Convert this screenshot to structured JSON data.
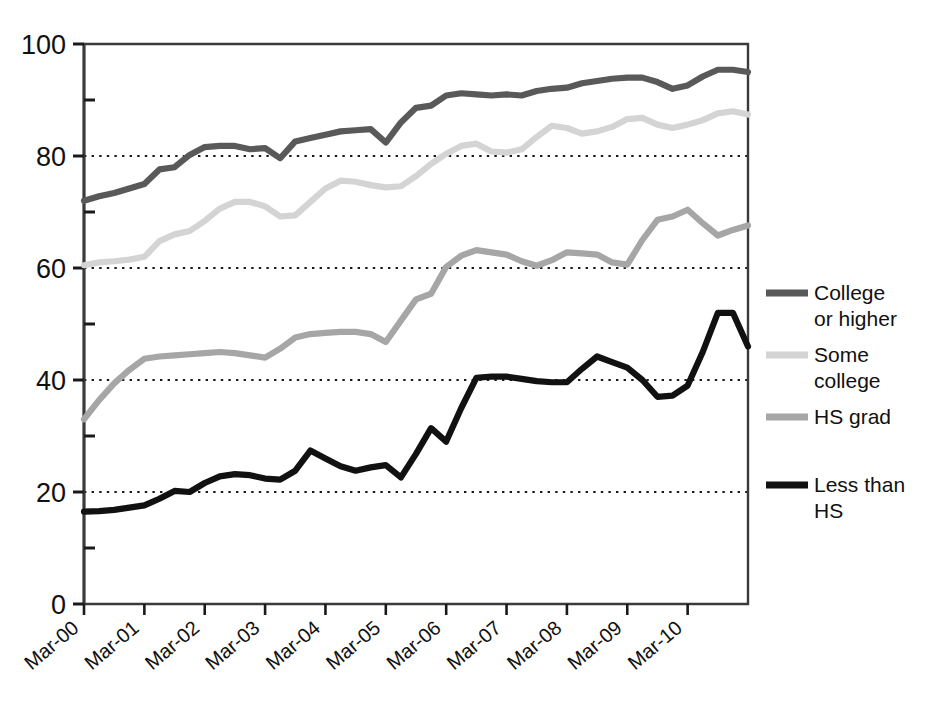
{
  "chart_data": {
    "type": "line",
    "title": "",
    "xlabel": "",
    "ylabel": "",
    "ylim": [
      0,
      100
    ],
    "yticks": [
      0,
      20,
      40,
      60,
      80,
      100
    ],
    "yticklabels": [
      "0",
      "20",
      "40",
      "60",
      "80",
      "100"
    ],
    "minor_yticks": [
      10,
      30,
      50,
      70,
      90
    ],
    "grid": "horizontal dotted at 20, 40, 60, 80",
    "legend_position": "right",
    "xticklabels": [
      "Mar-00",
      "Mar-01",
      "Mar-02",
      "Mar-03",
      "Mar-04",
      "Mar-05",
      "Mar-06",
      "Mar-07",
      "Mar-08",
      "Mar-09",
      "Mar-10"
    ],
    "x_tick_indices": [
      0,
      4,
      8,
      12,
      16,
      20,
      24,
      28,
      32,
      36,
      40
    ],
    "x_points": 45,
    "x_labels_rotation": -40,
    "series": [
      {
        "name": "College or higher",
        "color": "#595959",
        "values": [
          72.0,
          72.8,
          73.4,
          74.2,
          75.0,
          77.6,
          78.0,
          80.2,
          81.6,
          81.8,
          81.8,
          81.2,
          81.4,
          79.6,
          82.6,
          83.2,
          83.8,
          84.4,
          84.6,
          84.8,
          82.4,
          86.0,
          88.6,
          89.0,
          90.8,
          91.2,
          91.0,
          90.8,
          91.0,
          90.8,
          91.6,
          92.0,
          92.2,
          93.0,
          93.4,
          93.8,
          94.0,
          94.0,
          93.2,
          92.0,
          92.6,
          94.2,
          95.4,
          95.4,
          95.0
        ]
      },
      {
        "name": "Some college",
        "color": "#d4d4d4",
        "values": [
          60.5,
          61.0,
          61.2,
          61.5,
          62.0,
          64.8,
          66.0,
          66.6,
          68.4,
          70.6,
          71.8,
          71.8,
          71.0,
          69.2,
          69.4,
          71.8,
          74.2,
          75.6,
          75.4,
          74.8,
          74.4,
          74.6,
          76.4,
          78.6,
          80.4,
          81.8,
          82.2,
          80.8,
          80.6,
          81.2,
          83.4,
          85.4,
          85.0,
          84.0,
          84.4,
          85.2,
          86.6,
          86.8,
          85.6,
          85.0,
          85.6,
          86.4,
          87.6,
          88.0,
          87.4
        ]
      },
      {
        "name": "HS grad",
        "color": "#a6a6a6",
        "values": [
          33.0,
          36.4,
          39.4,
          41.8,
          43.8,
          44.2,
          44.4,
          44.6,
          44.8,
          45.0,
          44.8,
          44.4,
          44.0,
          45.6,
          47.6,
          48.2,
          48.4,
          48.6,
          48.6,
          48.2,
          46.8,
          50.6,
          54.4,
          55.4,
          60.2,
          62.2,
          63.2,
          62.8,
          62.4,
          61.2,
          60.4,
          61.4,
          62.8,
          62.6,
          62.4,
          61.0,
          60.6,
          65.0,
          68.6,
          69.2,
          70.4,
          68.0,
          65.8,
          66.8,
          67.6
        ]
      },
      {
        "name": "Less than HS",
        "color": "#111111",
        "values": [
          16.5,
          16.6,
          16.8,
          17.2,
          17.6,
          18.8,
          20.2,
          20.0,
          21.6,
          22.8,
          23.2,
          23.0,
          22.4,
          22.2,
          23.8,
          27.4,
          26.0,
          24.6,
          23.8,
          24.4,
          24.8,
          22.6,
          26.8,
          31.4,
          29.0,
          35.0,
          40.4,
          40.6,
          40.6,
          40.2,
          39.8,
          39.6,
          39.6,
          42.0,
          44.2,
          43.2,
          42.2,
          40.0,
          37.0,
          37.2,
          39.0,
          45.0,
          52.0,
          52.0,
          46.0
        ]
      }
    ]
  },
  "legend": {
    "items": [
      {
        "label_line1": "College",
        "label_line2": "or higher",
        "color": "#595959"
      },
      {
        "label_line1": "Some",
        "label_line2": "college",
        "color": "#d4d4d4"
      },
      {
        "label_line1": "HS grad",
        "label_line2": "",
        "color": "#a6a6a6"
      },
      {
        "label_line1": "Less than",
        "label_line2": "HS",
        "color": "#111111"
      }
    ]
  }
}
